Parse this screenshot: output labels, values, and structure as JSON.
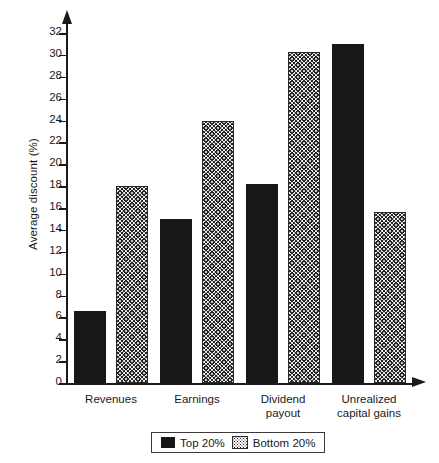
{
  "chart_data": {
    "type": "bar",
    "title": "",
    "xlabel": "",
    "ylabel": "Average discount (%)",
    "categories": [
      "Revenues",
      "Earnings",
      "Dividend\npayout",
      "Unrealized\ncapital gains"
    ],
    "series": [
      {
        "name": "Top 20%",
        "pattern": "solid",
        "values": [
          6.6,
          15.0,
          18.2,
          31.0
        ]
      },
      {
        "name": "Bottom 20%",
        "pattern": "stipple",
        "values": [
          18.0,
          24.0,
          30.3,
          15.6
        ]
      }
    ],
    "ylim": [
      0,
      32
    ],
    "ytick_step": 2,
    "yticks": [
      0,
      2,
      4,
      6,
      8,
      10,
      12,
      14,
      16,
      18,
      20,
      22,
      24,
      26,
      28,
      30,
      32
    ],
    "ytick_labels": [
      "0",
      "2",
      "4",
      "6",
      "8",
      "10",
      "12",
      "14",
      "16",
      "18",
      "20",
      "22",
      "24",
      "26",
      "28",
      "30",
      "32"
    ],
    "grid": false,
    "legend_position": "bottom-center",
    "axis_arrows": true,
    "colors": {
      "solid_series": "#171717",
      "stipple_series": "#2a2a2a",
      "axis": "#1a1a1a",
      "background": "#ffffff"
    }
  },
  "legend": {
    "entries": [
      {
        "label": "Top 20%",
        "pattern": "solid"
      },
      {
        "label": "Bottom 20%",
        "pattern": "stipple"
      }
    ]
  }
}
